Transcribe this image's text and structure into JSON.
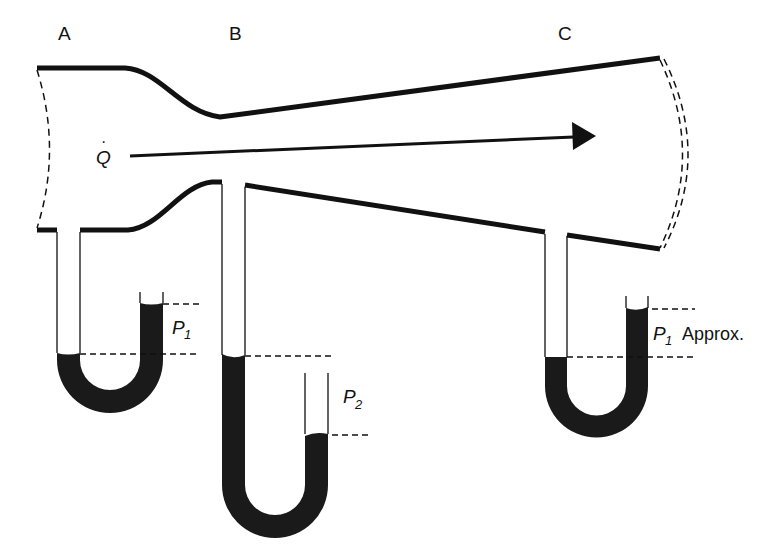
{
  "diagram": {
    "sections": [
      {
        "id": "A",
        "label": "A"
      },
      {
        "id": "B",
        "label": "B"
      },
      {
        "id": "C",
        "label": "C"
      }
    ],
    "flow": {
      "symbol": "Q",
      "dot": "·",
      "direction": "left-to-right"
    },
    "manometers": [
      {
        "at": "A",
        "pressure_label": "P",
        "subscript": "1",
        "suffix": ""
      },
      {
        "at": "B",
        "pressure_label": "P",
        "subscript": "2",
        "suffix": ""
      },
      {
        "at": "C",
        "pressure_label": "P",
        "subscript": "1",
        "suffix": "Approx."
      }
    ],
    "colors": {
      "line": "#111111",
      "fluid": "#1a1a1a",
      "background": "#ffffff"
    }
  }
}
